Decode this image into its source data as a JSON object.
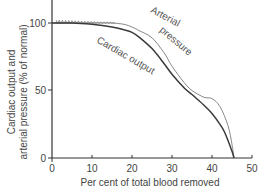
{
  "chart_data": {
    "type": "line",
    "title": "",
    "xlabel": "Per cent of total blood removed",
    "ylabel_line1": "Cardiac output and",
    "ylabel_line2": "arterial pressure (% of normal)",
    "xlim": [
      0,
      50
    ],
    "ylim": [
      0,
      115
    ],
    "xticks": [
      0,
      10,
      20,
      30,
      40,
      50
    ],
    "yticks": [
      0,
      50,
      100
    ],
    "grid": false,
    "legend": "none (curves labelled inline)",
    "series": [
      {
        "name": "Arterial pressure",
        "style": "thin jagged/grey",
        "color": "#7a7a7a",
        "x": [
          0,
          2,
          5,
          8,
          12,
          15,
          18,
          20,
          22,
          25,
          28,
          30,
          33,
          35,
          38,
          40,
          42,
          44,
          45,
          45.5
        ],
        "values": [
          100,
          100,
          100,
          100,
          100,
          100,
          99,
          97,
          94,
          89,
          78,
          68,
          56,
          50,
          45,
          44,
          38,
          24,
          10,
          0
        ]
      },
      {
        "name": "Cardiac output",
        "style": "solid dark",
        "color": "#3a3a3a",
        "x": [
          0,
          5,
          10,
          15,
          18,
          20,
          22,
          25,
          28,
          30,
          33,
          35,
          38,
          40,
          42,
          43,
          44,
          45,
          45.5
        ],
        "values": [
          100,
          100,
          99,
          97,
          95,
          93,
          89,
          81,
          70,
          62,
          52,
          47,
          39,
          33,
          25,
          20,
          13,
          5,
          0
        ]
      }
    ],
    "annotations": [
      {
        "text": "Arterial",
        "near_x": 26,
        "near_y": 104
      },
      {
        "text": "pressure",
        "near_x": 32,
        "near_y": 90
      },
      {
        "text": "Cardiac output",
        "near_x": 22,
        "near_y": 70
      }
    ]
  },
  "labels": {
    "x0": "0",
    "x10": "10",
    "x20": "20",
    "x30": "30",
    "x40": "40",
    "x50": "50",
    "y0": "0",
    "y50": "50",
    "y100": "100",
    "arterial_word1": "Arterial",
    "arterial_word2": "pressure",
    "cardiac_label": "Cardiac output"
  }
}
